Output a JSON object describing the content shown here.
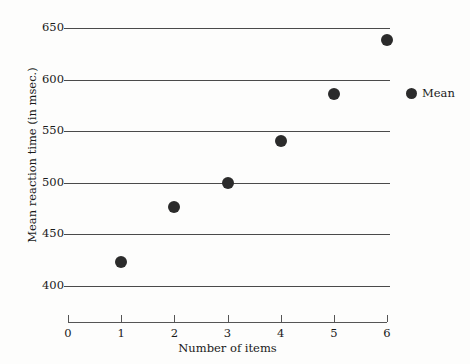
{
  "chart_data": {
    "type": "scatter",
    "title": "",
    "xlabel": "Number of items",
    "ylabel": "Mean reaction time (in msec.)",
    "x": [
      1,
      2,
      3,
      4,
      5,
      6
    ],
    "values": [
      423,
      476,
      500,
      540,
      586,
      638
    ],
    "series": [
      {
        "name": "Mean",
        "x": [
          1,
          2,
          3,
          4,
          5,
          6
        ],
        "values": [
          423,
          476,
          500,
          540,
          586,
          638
        ]
      }
    ],
    "xlim": [
      0,
      6
    ],
    "ylim": [
      400,
      650
    ],
    "xticks": [
      "0",
      "1",
      "2",
      "3",
      "4",
      "5",
      "6"
    ],
    "yticks": [
      "400",
      "450",
      "500",
      "550",
      "600",
      "650"
    ],
    "grid": "horizontal",
    "legend_position": "right",
    "legend": [
      "Mean"
    ],
    "marker_color": "#2b2b2b",
    "gridline_color": "#4a4a4a",
    "background_color": "#fdfdfc"
  },
  "axes": {
    "y": {
      "title": "Mean reaction time (in msec.)",
      "ticks": [
        {
          "label": "650",
          "value": 650
        },
        {
          "label": "600",
          "value": 600
        },
        {
          "label": "550",
          "value": 550
        },
        {
          "label": "500",
          "value": 500
        },
        {
          "label": "450",
          "value": 450
        },
        {
          "label": "400",
          "value": 400
        }
      ]
    },
    "x": {
      "title": "Number of items",
      "ticks": [
        {
          "label": "0",
          "value": 0
        },
        {
          "label": "1",
          "value": 1
        },
        {
          "label": "2",
          "value": 2
        },
        {
          "label": "3",
          "value": 3
        },
        {
          "label": "4",
          "value": 4
        },
        {
          "label": "5",
          "value": 5
        },
        {
          "label": "6",
          "value": 6
        }
      ]
    }
  },
  "legend": {
    "entries": [
      {
        "label": "Mean",
        "marker": "filled-circle"
      }
    ]
  }
}
